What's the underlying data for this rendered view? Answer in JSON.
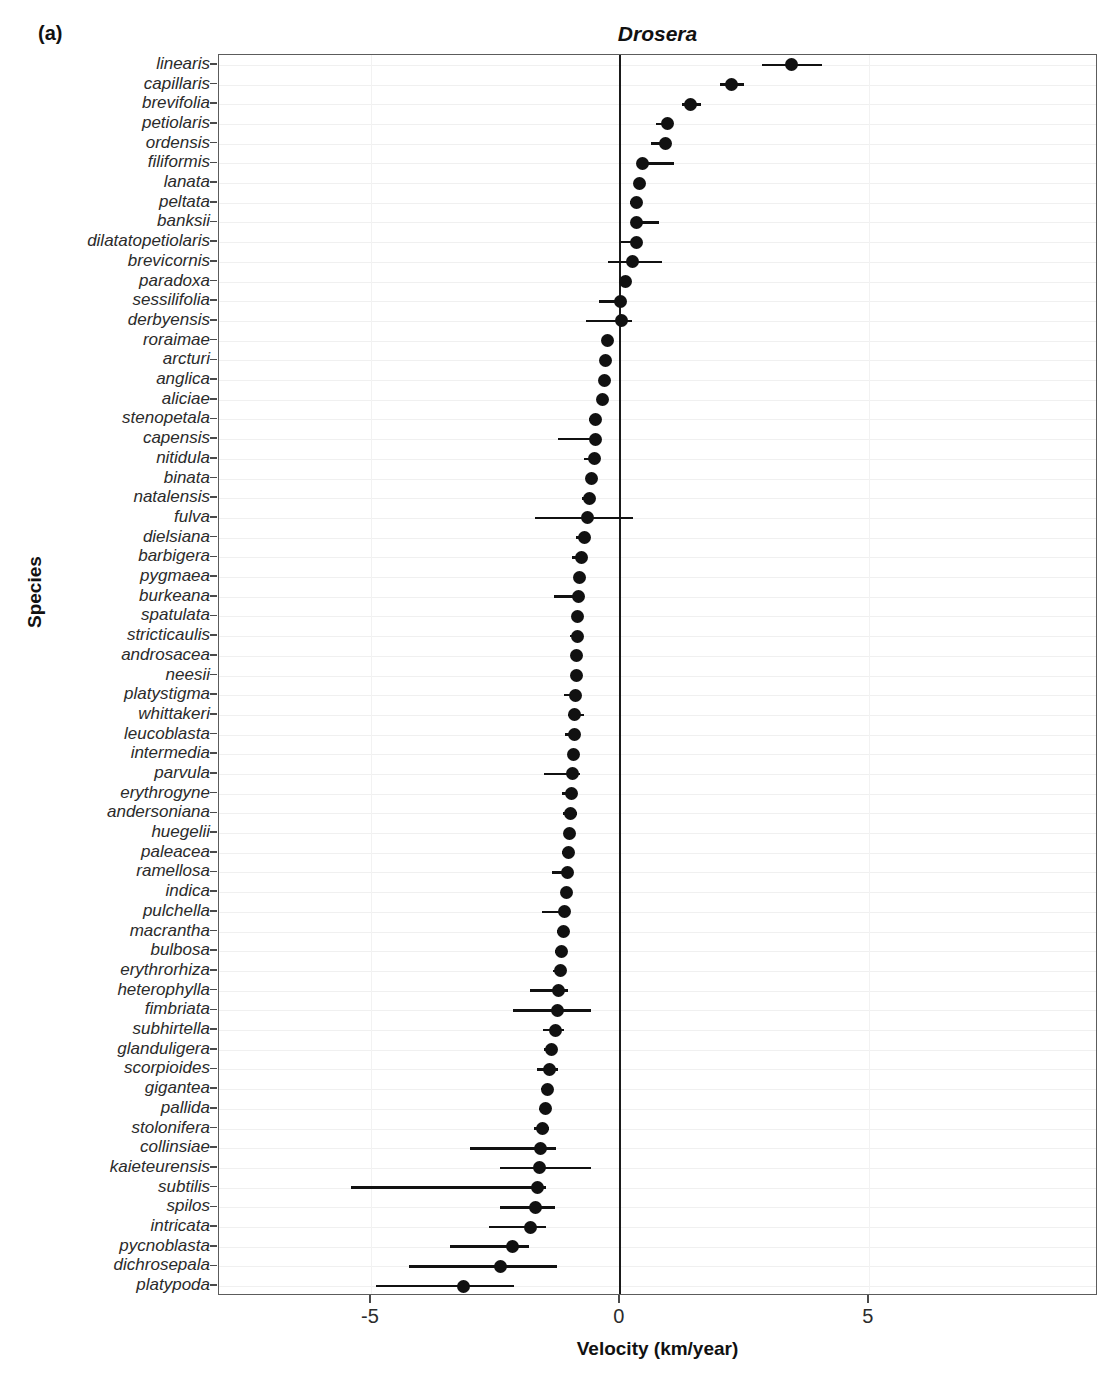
{
  "panel_label": "(a)",
  "facet_title": "Drosera",
  "y_axis_title": "Species",
  "x_axis_title": "Velocity (km/year)",
  "chart_data": {
    "type": "scatter",
    "plot_style": "forest-plot (point estimate with error bars)",
    "title": "Drosera",
    "xlabel": "Velocity (km/year)",
    "ylabel": "Species",
    "xlim": [
      -8.05,
      9.6
    ],
    "xticks": [
      -5,
      0,
      5
    ],
    "xtick_labels": [
      "-5",
      "0",
      "5"
    ],
    "grid": "faint horizontal gridline per species row, faint vertical gridlines at ticks",
    "reference_line": 0,
    "point_color": "#111111",
    "errorbar_color": "#111111",
    "categories": [
      "linearis",
      "capillaris",
      "brevifolia",
      "petiolaris",
      "ordensis",
      "filiformis",
      "lanata",
      "peltata",
      "banksii",
      "dilatatopetiolaris",
      "brevicornis",
      "paradoxa",
      "sessilifolia",
      "derbyensis",
      "roraimae",
      "arcturi",
      "anglica",
      "aliciae",
      "stenopetala",
      "capensis",
      "nitidula",
      "binata",
      "natalensis",
      "fulva",
      "dielsiana",
      "barbigera",
      "pygmaea",
      "burkeana",
      "spatulata",
      "stricticaulis",
      "androsacea",
      "neesii",
      "platystigma",
      "whittakeri",
      "leucoblasta",
      "intermedia",
      "parvula",
      "erythrogyne",
      "andersoniana",
      "huegelii",
      "paleacea",
      "ramellosa",
      "indica",
      "pulchella",
      "macrantha",
      "bulbosa",
      "erythrorhiza",
      "heterophylla",
      "fimbriata",
      "subhirtella",
      "glanduligera",
      "scorpioides",
      "gigantea",
      "pallida",
      "stolonifera",
      "collinsiae",
      "kaieteurensis",
      "subtilis",
      "spilos",
      "intricata",
      "pycnoblasta",
      "dichrosepala",
      "platypoda"
    ],
    "points": [
      {
        "species": "linearis",
        "value": 3.45,
        "low": 2.85,
        "high": 4.05
      },
      {
        "species": "capillaris",
        "value": 2.25,
        "low": 2.0,
        "high": 2.5
      },
      {
        "species": "brevifolia",
        "value": 1.42,
        "low": 1.25,
        "high": 1.62
      },
      {
        "species": "petiolaris",
        "value": 0.95,
        "low": 0.72,
        "high": 1.02
      },
      {
        "species": "ordensis",
        "value": 0.92,
        "low": 0.62,
        "high": 1.02
      },
      {
        "species": "filiformis",
        "value": 0.46,
        "low": 0.4,
        "high": 1.08
      },
      {
        "species": "lanata",
        "value": 0.4,
        "low": 0.34,
        "high": 0.46
      },
      {
        "species": "peltata",
        "value": 0.34,
        "low": 0.2,
        "high": 0.44
      },
      {
        "species": "banksii",
        "value": 0.33,
        "low": 0.28,
        "high": 0.78
      },
      {
        "species": "dilatatopetiolaris",
        "value": 0.34,
        "low": 0.02,
        "high": 0.44
      },
      {
        "species": "brevicornis",
        "value": 0.26,
        "low": -0.24,
        "high": 0.84
      },
      {
        "species": "paradoxa",
        "value": 0.12,
        "low": 0.04,
        "high": 0.2
      },
      {
        "species": "sessilifolia",
        "value": 0.02,
        "low": -0.42,
        "high": 0.1
      },
      {
        "species": "derbyensis",
        "value": 0.04,
        "low": -0.68,
        "high": 0.24
      },
      {
        "species": "roraimae",
        "value": -0.25,
        "low": -0.34,
        "high": -0.16
      },
      {
        "species": "arcturi",
        "value": -0.28,
        "low": -0.36,
        "high": -0.2
      },
      {
        "species": "anglica",
        "value": -0.3,
        "low": -0.38,
        "high": -0.22
      },
      {
        "species": "aliciae",
        "value": -0.34,
        "low": -0.42,
        "high": -0.26
      },
      {
        "species": "stenopetala",
        "value": -0.5,
        "low": -0.62,
        "high": -0.4
      },
      {
        "species": "capensis",
        "value": -0.48,
        "low": -1.25,
        "high": -0.4
      },
      {
        "species": "nitidula",
        "value": -0.52,
        "low": -0.72,
        "high": -0.44
      },
      {
        "species": "binata",
        "value": -0.58,
        "low": -0.66,
        "high": -0.5
      },
      {
        "species": "natalensis",
        "value": -0.62,
        "low": -0.76,
        "high": -0.52
      },
      {
        "species": "fulva",
        "value": -0.66,
        "low": -1.7,
        "high": 0.26
      },
      {
        "species": "dielsiana",
        "value": -0.72,
        "low": -0.88,
        "high": -0.6
      },
      {
        "species": "barbigera",
        "value": -0.78,
        "low": -0.96,
        "high": -0.66
      },
      {
        "species": "pygmaea",
        "value": -0.82,
        "low": -0.92,
        "high": -0.74
      },
      {
        "species": "burkeana",
        "value": -0.84,
        "low": -1.32,
        "high": -0.72
      },
      {
        "species": "spatulata",
        "value": -0.86,
        "low": -0.94,
        "high": -0.78
      },
      {
        "species": "stricticaulis",
        "value": -0.86,
        "low": -1.0,
        "high": -0.76
      },
      {
        "species": "androsacea",
        "value": -0.88,
        "low": -0.96,
        "high": -0.8
      },
      {
        "species": "neesii",
        "value": -0.88,
        "low": -0.98,
        "high": -0.78
      },
      {
        "species": "platystigma",
        "value": -0.9,
        "low": -1.12,
        "high": -0.82
      },
      {
        "species": "whittakeri",
        "value": -0.92,
        "low": -1.04,
        "high": -0.72
      },
      {
        "species": "leucoblasta",
        "value": -0.92,
        "low": -1.1,
        "high": -0.82
      },
      {
        "species": "intermedia",
        "value": -0.94,
        "low": -1.02,
        "high": -0.86
      },
      {
        "species": "parvula",
        "value": -0.96,
        "low": -1.52,
        "high": -0.8
      },
      {
        "species": "erythrogyne",
        "value": -0.98,
        "low": -1.16,
        "high": -0.86
      },
      {
        "species": "andersoniana",
        "value": -1.0,
        "low": -1.14,
        "high": -0.86
      },
      {
        "species": "huegelii",
        "value": -1.02,
        "low": -1.12,
        "high": -0.92
      },
      {
        "species": "paleacea",
        "value": -1.04,
        "low": -1.16,
        "high": -0.94
      },
      {
        "species": "ramellosa",
        "value": -1.06,
        "low": -1.36,
        "high": -0.94
      },
      {
        "species": "indica",
        "value": -1.08,
        "low": -1.18,
        "high": -0.98
      },
      {
        "species": "pulchella",
        "value": -1.12,
        "low": -1.56,
        "high": -1.0
      },
      {
        "species": "macrantha",
        "value": -1.14,
        "low": -1.26,
        "high": -1.04
      },
      {
        "species": "bulbosa",
        "value": -1.18,
        "low": -1.3,
        "high": -1.06
      },
      {
        "species": "erythrorhiza",
        "value": -1.2,
        "low": -1.34,
        "high": -1.08
      },
      {
        "species": "heterophylla",
        "value": -1.24,
        "low": -1.8,
        "high": -1.04
      },
      {
        "species": "fimbriata",
        "value": -1.26,
        "low": -2.14,
        "high": -0.58
      },
      {
        "species": "subhirtella",
        "value": -1.3,
        "low": -1.54,
        "high": -1.12
      },
      {
        "species": "glanduligera",
        "value": -1.38,
        "low": -1.52,
        "high": -1.26
      },
      {
        "species": "scorpioides",
        "value": -1.42,
        "low": -1.66,
        "high": -1.24
      },
      {
        "species": "gigantea",
        "value": -1.46,
        "low": -1.58,
        "high": -1.34
      },
      {
        "species": "pallida",
        "value": -1.5,
        "low": -1.62,
        "high": -1.38
      },
      {
        "species": "stolonifera",
        "value": -1.56,
        "low": -1.72,
        "high": -1.42
      },
      {
        "species": "collinsiae",
        "value": -1.6,
        "low": -3.0,
        "high": -1.28
      },
      {
        "species": "kaieteurensis",
        "value": -1.62,
        "low": -2.4,
        "high": -0.58
      },
      {
        "species": "subtilis",
        "value": -1.66,
        "low": -5.4,
        "high": -1.48
      },
      {
        "species": "spilos",
        "value": -1.7,
        "low": -2.4,
        "high": -1.3
      },
      {
        "species": "intricata",
        "value": -1.8,
        "low": -2.62,
        "high": -1.48
      },
      {
        "species": "pycnoblasta",
        "value": -2.16,
        "low": -3.42,
        "high": -1.82
      },
      {
        "species": "dichrosepala",
        "value": -2.4,
        "low": -4.24,
        "high": -1.26
      },
      {
        "species": "platypoda",
        "value": -3.14,
        "low": -4.9,
        "high": -2.12
      }
    ]
  }
}
